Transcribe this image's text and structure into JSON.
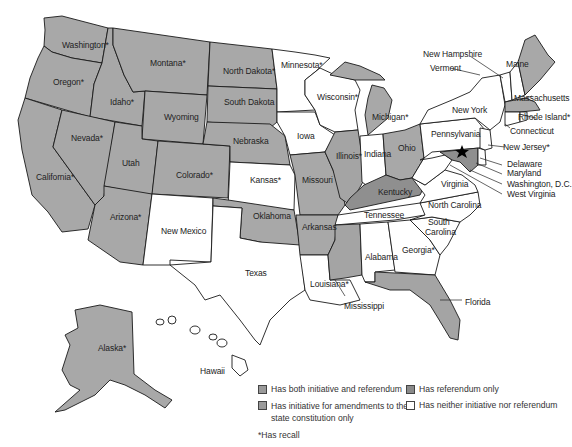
{
  "map": {
    "colors": {
      "both": "#a8a8a8",
      "amendments_only": "#a4a4a4",
      "referendum_only": "#8f8f8f",
      "neither": "#ffffff",
      "border": "#1a1a1a"
    },
    "states": [
      {
        "name": "Washington*",
        "category": "both"
      },
      {
        "name": "Oregon*",
        "category": "both"
      },
      {
        "name": "California*",
        "category": "both"
      },
      {
        "name": "Idaho*",
        "category": "both"
      },
      {
        "name": "Nevada*",
        "category": "both"
      },
      {
        "name": "Montana*",
        "category": "both"
      },
      {
        "name": "Wyoming",
        "category": "both"
      },
      {
        "name": "Utah",
        "category": "both"
      },
      {
        "name": "Colorado*",
        "category": "both"
      },
      {
        "name": "Arizona*",
        "category": "both"
      },
      {
        "name": "New Mexico",
        "category": "neither"
      },
      {
        "name": "North Dakota*",
        "category": "both"
      },
      {
        "name": "South Dakota",
        "category": "both"
      },
      {
        "name": "Nebraska",
        "category": "both"
      },
      {
        "name": "Kansas*",
        "category": "neither"
      },
      {
        "name": "Oklahoma",
        "category": "both"
      },
      {
        "name": "Texas",
        "category": "neither"
      },
      {
        "name": "Minnesota*",
        "category": "neither"
      },
      {
        "name": "Iowa",
        "category": "neither"
      },
      {
        "name": "Missouri",
        "category": "both"
      },
      {
        "name": "Arkansas",
        "category": "both"
      },
      {
        "name": "Louisiana*",
        "category": "neither"
      },
      {
        "name": "Wisconsin*",
        "category": "neither"
      },
      {
        "name": "Illinois*",
        "category": "amendments_only"
      },
      {
        "name": "Michigan*",
        "category": "both"
      },
      {
        "name": "Indiana",
        "category": "neither"
      },
      {
        "name": "Ohio",
        "category": "both"
      },
      {
        "name": "Kentucky",
        "category": "referendum_only"
      },
      {
        "name": "Tennessee",
        "category": "neither"
      },
      {
        "name": "Mississippi",
        "category": "amendments_only"
      },
      {
        "name": "Alabama",
        "category": "neither"
      },
      {
        "name": "Georgia*",
        "category": "neither"
      },
      {
        "name": "Florida",
        "category": "amendments_only"
      },
      {
        "name": "South Carolina",
        "category": "neither"
      },
      {
        "name": "North Carolina",
        "category": "neither"
      },
      {
        "name": "Virginia",
        "category": "neither"
      },
      {
        "name": "West Virginia",
        "category": "neither"
      },
      {
        "name": "Washington, D.C.",
        "category": "marker"
      },
      {
        "name": "Maryland",
        "category": "referendum_only"
      },
      {
        "name": "Delaware",
        "category": "neither"
      },
      {
        "name": "New Jersey*",
        "category": "neither"
      },
      {
        "name": "Pennsylvania",
        "category": "neither"
      },
      {
        "name": "New York",
        "category": "neither"
      },
      {
        "name": "Connecticut",
        "category": "neither"
      },
      {
        "name": "Rhode Island*",
        "category": "neither"
      },
      {
        "name": "Massachusetts",
        "category": "both"
      },
      {
        "name": "Vermont",
        "category": "neither"
      },
      {
        "name": "New Hampshire",
        "category": "neither"
      },
      {
        "name": "Maine",
        "category": "both"
      },
      {
        "name": "Alaska*",
        "category": "both"
      },
      {
        "name": "Hawaii",
        "category": "neither"
      }
    ],
    "labels": {
      "washington": "Washington*",
      "oregon": "Oregon*",
      "california": "California*",
      "idaho": "Idaho*",
      "nevada": "Nevada*",
      "montana": "Montana*",
      "wyoming": "Wyoming",
      "utah": "Utah",
      "colorado": "Colorado*",
      "arizona": "Arizona*",
      "new_mexico": "New Mexico",
      "north_dakota": "North Dakota*",
      "south_dakota": "South Dakota",
      "nebraska": "Nebraska",
      "kansas": "Kansas*",
      "oklahoma": "Oklahoma",
      "texas": "Texas",
      "minnesota": "Minnesota*",
      "iowa": "Iowa",
      "missouri": "Missouri",
      "arkansas": "Arkansas",
      "louisiana": "Louisiana*",
      "wisconsin": "Wisconsin*",
      "illinois": "Illinois*",
      "michigan": "Michigan*",
      "indiana": "Indiana",
      "ohio": "Ohio",
      "kentucky": "Kentucky",
      "tennessee": "Tennessee",
      "mississippi": "Mississippi",
      "alabama": "Alabama",
      "georgia": "Georgia*",
      "florida": "Florida",
      "south_carolina_1": "South",
      "south_carolina_2": "Carolina",
      "north_carolina": "North Carolina",
      "virginia": "Virginia",
      "west_virginia": "West Virginia",
      "washington_dc": "Washington, D.C.",
      "maryland": "Maryland",
      "delaware": "Delaware",
      "new_jersey": "New Jersey*",
      "pennsylvania": "Pennsylvania",
      "new_york": "New York",
      "connecticut": "Connecticut",
      "rhode_island": "Rhode Island*",
      "massachusetts": "Massachusetts",
      "vermont": "Vermont",
      "new_hampshire": "New Hampshire",
      "maine": "Maine",
      "alaska": "Alaska*",
      "hawaii": "Hawaii"
    }
  },
  "legend": {
    "items": [
      {
        "label": "Has both initiative and referendum",
        "swatch": "both"
      },
      {
        "label": "Has referendum only",
        "swatch": "referendum_only"
      },
      {
        "label_line1": "Has initiative for amendments to the",
        "label_line2": "state constitution only",
        "swatch": "amendments_only"
      },
      {
        "label": "Has neither initiative nor referendum",
        "swatch": "neither"
      }
    ],
    "note": "*Has recall"
  }
}
